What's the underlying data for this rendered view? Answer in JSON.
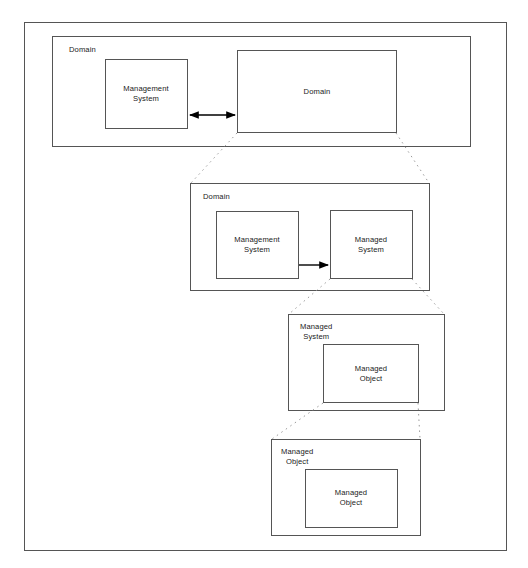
{
  "diagram": {
    "stroke_color": "#555555",
    "accent_color": "#000000",
    "background_color": "#ffffff",
    "frame": {
      "label": "outer-frame"
    },
    "tiers": [
      {
        "id": "tier-1",
        "container_label": "Domain",
        "boxes": [
          {
            "id": "t1-management-system",
            "label": "Management\nSystem"
          },
          {
            "id": "t1-domain",
            "label": "Domain"
          }
        ],
        "connector": {
          "type": "double-arrow",
          "label": "bidirectional"
        }
      },
      {
        "id": "tier-2",
        "container_label": "Domain",
        "boxes": [
          {
            "id": "t2-management-system",
            "label": "Management\nSystem"
          },
          {
            "id": "t2-managed-system",
            "label": "Managed\nSystem"
          }
        ],
        "connector": {
          "type": "single-arrow",
          "label": "manages"
        }
      },
      {
        "id": "tier-3",
        "container_label": "Managed\nSystem",
        "boxes": [
          {
            "id": "t3-managed-object",
            "label": "Managed\nObject"
          }
        ]
      },
      {
        "id": "tier-4",
        "container_label": "Managed\nObject",
        "boxes": [
          {
            "id": "t4-managed-object",
            "label": "Managed\nObject"
          }
        ]
      }
    ],
    "expansion_links": [
      {
        "from": "t1-domain",
        "to": "tier-2",
        "style": "dotted"
      },
      {
        "from": "t2-managed-system",
        "to": "tier-3",
        "style": "dotted"
      },
      {
        "from": "t3-managed-object",
        "to": "tier-4",
        "style": "dotted"
      }
    ]
  }
}
